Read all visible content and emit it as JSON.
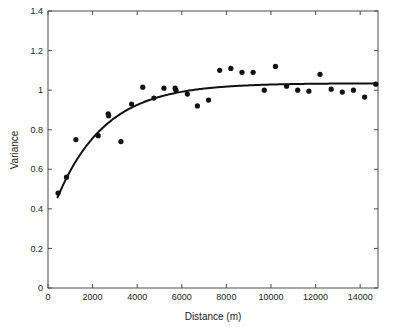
{
  "chart_data": {
    "type": "scatter",
    "title": "",
    "subtitle": "",
    "xlabel": "Distance (m)",
    "ylabel": "Variance",
    "xlim": [
      0,
      14800
    ],
    "ylim": [
      0,
      1.4
    ],
    "xticks": [
      0,
      2000,
      4000,
      6000,
      8000,
      10000,
      12000,
      14000
    ],
    "xticklabels": [
      "0",
      "2000",
      "4000",
      "6000",
      "8000",
      "10000",
      "12000",
      "14000"
    ],
    "yticks": [
      0,
      0.2,
      0.4,
      0.6,
      0.8,
      1,
      1.2,
      1.4
    ],
    "yticklabels": [
      "0",
      "0.2",
      "0.4",
      "0.6",
      "0.8",
      "1",
      "1.2",
      "1.4"
    ],
    "grid": false,
    "legend": null,
    "legend_position": "none",
    "marker_color": "#111111",
    "curve_color": "#111111",
    "axis_color": "#4d4d4d",
    "background_color": "#ffffff",
    "series": [
      {
        "name": "Empirical variogram",
        "type": "scatter",
        "marker": "filled-circle",
        "x": [
          450,
          830,
          1250,
          2250,
          2700,
          2720,
          3270,
          3750,
          4250,
          4750,
          5200,
          5700,
          5740,
          6250,
          6700,
          7200,
          7700,
          8200,
          8700,
          9200,
          9700,
          10200,
          10700,
          11200,
          11700,
          12200,
          12700,
          13200,
          13700,
          14200,
          14700
        ],
        "y": [
          0.48,
          0.56,
          0.75,
          0.77,
          0.88,
          0.87,
          0.74,
          0.93,
          1.015,
          0.96,
          1.01,
          1.01,
          1.0,
          0.98,
          0.92,
          0.95,
          1.1,
          1.11,
          1.09,
          1.09,
          1.0,
          1.12,
          1.02,
          1.0,
          0.995,
          1.08,
          1.005,
          0.99,
          1.0,
          0.965,
          1.03
        ]
      },
      {
        "name": "Fitted exponential model",
        "type": "line",
        "model": "exponential",
        "nugget": 0.33,
        "sill": 1.035,
        "range": 2150
      }
    ]
  },
  "figure": {
    "ylabel": "Variance",
    "xlabel": "Distance (m)"
  }
}
